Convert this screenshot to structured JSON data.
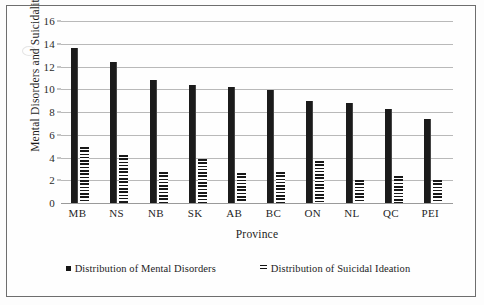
{
  "chart_data": {
    "type": "bar",
    "title": "",
    "xlabel": "Province",
    "ylabel": "Mental Disorders and Suicidality (%)",
    "categories": [
      "MB",
      "NS",
      "NB",
      "SK",
      "AB",
      "BC",
      "ON",
      "NL",
      "QC",
      "PEI"
    ],
    "series": [
      {
        "name": "Distribution of Mental Disorders",
        "values": [
          13.6,
          12.4,
          10.8,
          10.4,
          10.2,
          9.9,
          9.0,
          8.8,
          8.3,
          7.4
        ]
      },
      {
        "name": "Distribution of Suicidal Ideation",
        "values": [
          4.9,
          4.2,
          2.7,
          3.9,
          2.6,
          2.7,
          3.7,
          2.0,
          2.4,
          2.0
        ]
      }
    ],
    "ylim": [
      0,
      16
    ],
    "yticks": [
      0,
      2,
      4,
      6,
      8,
      10,
      12,
      14,
      16
    ],
    "ytick_labels": [
      "0",
      "2",
      "4",
      "6",
      "8",
      "10",
      "12",
      "14",
      "16"
    ],
    "grid": true,
    "legend_position": "bottom",
    "colors": {
      "series_1": "#1b1b1b",
      "series_2": "#181818",
      "gridline": "#b9b9b9",
      "frame": "#6e6e6e",
      "background": "#fefefe"
    }
  },
  "legend": {
    "items": [
      {
        "label": "Distribution of Mental Disorders",
        "marker": "solid-square-marker"
      },
      {
        "label": "Distribution of Suicidal Ideation",
        "marker": "striped-bar-marker"
      }
    ]
  }
}
